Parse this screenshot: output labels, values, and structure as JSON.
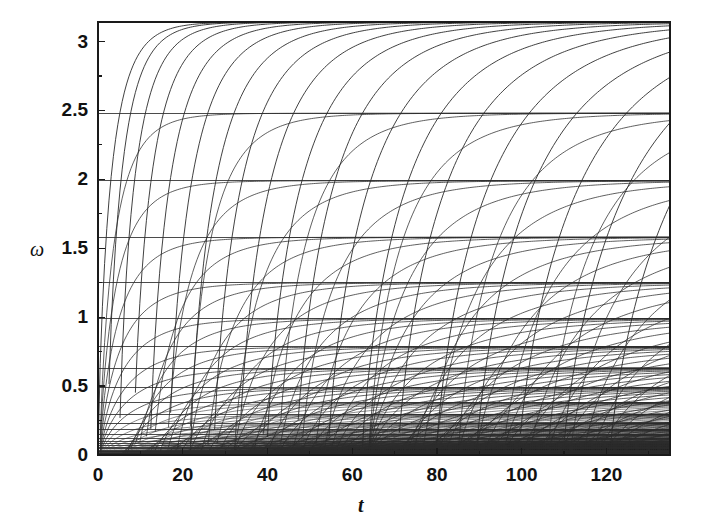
{
  "figure": {
    "background_color": "#ffffff",
    "line_color": "#2b2b2b",
    "axis_color": "#1a1a1a",
    "text_color": "#111111"
  },
  "chart_data": {
    "type": "line",
    "title": "",
    "subtitle": "",
    "xlabel": "t",
    "ylabel": "ω",
    "xlim": [
      0,
      135
    ],
    "ylim": [
      0,
      3.1416
    ],
    "grid": false,
    "legend": null,
    "annotations": [],
    "x_ticks": [
      0,
      20,
      40,
      60,
      80,
      100,
      120
    ],
    "x_tick_labels": [
      "0",
      "20",
      "40",
      "60",
      "80",
      "100",
      "120"
    ],
    "x_minor_ticks": [
      10,
      30,
      50,
      70,
      90,
      110,
      130
    ],
    "y_ticks": [
      0,
      0.5,
      1,
      1.5,
      2,
      2.5,
      3
    ],
    "y_tick_labels": [
      "0",
      "0.5",
      "1",
      "1.5",
      "2",
      "2.5",
      "3"
    ],
    "y_minor_ticks": [
      0.25,
      0.75,
      1.25,
      1.75,
      2.25,
      2.75
    ],
    "asymptotes": [
      3.1416,
      2.48,
      1.99,
      1.58,
      1.25,
      0.99,
      0.785,
      0.63,
      0.49,
      0.38,
      0.295,
      0.232,
      0.185,
      0.148,
      0.12,
      0.098,
      0.08,
      0.066,
      0.054,
      0.044,
      0.036,
      0.029,
      0.023,
      0.018,
      0.014,
      0.011,
      0.008,
      0.006,
      0.004,
      0.003
    ],
    "series": [
      {
        "name": "branch-1",
        "asymptote": 3.1416,
        "onset_t": 0.0,
        "rise_scale": 3.0
      },
      {
        "name": "branch-2",
        "asymptote": 3.1416,
        "onset_t": 2.2,
        "rise_scale": 3.2
      },
      {
        "name": "branch-3",
        "asymptote": 3.1416,
        "onset_t": 5.0,
        "rise_scale": 3.6
      },
      {
        "name": "branch-4",
        "asymptote": 3.1416,
        "onset_t": 8.4,
        "rise_scale": 4.1
      },
      {
        "name": "branch-5",
        "asymptote": 3.1416,
        "onset_t": 12.3,
        "rise_scale": 4.7
      },
      {
        "name": "branch-6",
        "asymptote": 3.1416,
        "onset_t": 16.8,
        "rise_scale": 5.3
      },
      {
        "name": "branch-7",
        "asymptote": 3.1416,
        "onset_t": 21.8,
        "rise_scale": 6.0
      },
      {
        "name": "branch-8",
        "asymptote": 3.1416,
        "onset_t": 27.3,
        "rise_scale": 6.7
      },
      {
        "name": "branch-9",
        "asymptote": 3.1416,
        "onset_t": 33.3,
        "rise_scale": 7.5
      },
      {
        "name": "branch-10",
        "asymptote": 3.1416,
        "onset_t": 39.8,
        "rise_scale": 8.3
      },
      {
        "name": "branch-11",
        "asymptote": 3.1416,
        "onset_t": 46.8,
        "rise_scale": 9.1
      },
      {
        "name": "branch-12",
        "asymptote": 3.1416,
        "onset_t": 54.3,
        "rise_scale": 10.0
      },
      {
        "name": "branch-13",
        "asymptote": 3.1416,
        "onset_t": 62.3,
        "rise_scale": 10.9
      },
      {
        "name": "branch-14",
        "asymptote": 3.1416,
        "onset_t": 70.8,
        "rise_scale": 11.8
      },
      {
        "name": "branch-15",
        "asymptote": 3.1416,
        "onset_t": 79.8,
        "rise_scale": 12.8
      },
      {
        "name": "branch-16",
        "asymptote": 3.1416,
        "onset_t": 89.3,
        "rise_scale": 13.8
      },
      {
        "name": "branch-17",
        "asymptote": 3.1416,
        "onset_t": 99.3,
        "rise_scale": 14.8
      },
      {
        "name": "branch-18",
        "asymptote": 3.1416,
        "onset_t": 109.8,
        "rise_scale": 15.9
      },
      {
        "name": "branch-19",
        "asymptote": 3.1416,
        "onset_t": 120.8,
        "rise_scale": 17.0
      }
    ]
  },
  "axes": {
    "frame": {
      "left_px": 98,
      "top_px": 22,
      "right_px": 670,
      "bottom_px": 455
    },
    "frame_visible": true
  }
}
